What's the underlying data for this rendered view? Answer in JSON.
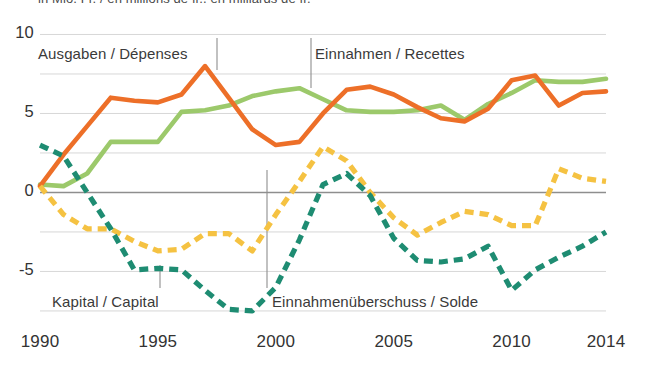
{
  "top_cut_title": "in Mio. Fr. / en millions de fr., en milliards de fr.",
  "axes": {
    "y_ticks": [
      "10",
      "5",
      "0",
      "-5"
    ],
    "y_tick_values": [
      10,
      5,
      0,
      -5
    ],
    "x_ticks": [
      "1990",
      "1995",
      "2000",
      "2005",
      "2010",
      "2014"
    ],
    "x_tick_values": [
      1990,
      1995,
      2000,
      2005,
      2010,
      2014
    ]
  },
  "annotations": [
    {
      "name": "ausgaben",
      "label": "Ausgaben / Dépenses",
      "x": 38,
      "y": 45
    },
    {
      "name": "einnahmen",
      "label": "Einnahmen / Recettes",
      "x": 315,
      "y": 45
    },
    {
      "name": "kapital",
      "label": "Kapital / Capital",
      "x": 52,
      "y": 293
    },
    {
      "name": "solde",
      "label": "Einnahmenüberschuss / Solde",
      "x": 272,
      "y": 293
    }
  ],
  "colors": {
    "ausgaben": "#ED6F28",
    "einnahmen": "#9CC96B",
    "kapital": "#F5C242",
    "solde": "#1E8C72",
    "grid": "#d7d7d7",
    "zero_line": "#8e8e8e",
    "text": "#3a3a3a",
    "background": "#ffffff"
  },
  "chart_data": {
    "type": "line",
    "title": "",
    "xlabel": "",
    "ylabel": "",
    "xlim": [
      1990,
      2014
    ],
    "ylim": [
      -8.2,
      10.6
    ],
    "grid": true,
    "grid_step": 2.5,
    "legend_position": "inline-annotations",
    "x": [
      1990,
      1991,
      1992,
      1993,
      1994,
      1995,
      1996,
      1997,
      1998,
      1999,
      2000,
      2001,
      2002,
      2003,
      2004,
      2005,
      2006,
      2007,
      2008,
      2009,
      2010,
      2011,
      2012,
      2013,
      2014
    ],
    "series": [
      {
        "name": "Ausgaben / Dépenses",
        "label": "Ausgaben / Dépenses",
        "color": "#ED6F28",
        "style": "solid",
        "values": [
          0.4,
          2.4,
          4.2,
          6.0,
          5.8,
          5.7,
          6.2,
          8.0,
          6.0,
          4.0,
          3.0,
          3.2,
          5.0,
          6.5,
          6.7,
          6.2,
          5.4,
          4.7,
          4.5,
          5.3,
          7.1,
          7.4,
          5.5,
          6.3,
          6.4
        ]
      },
      {
        "name": "Einnahmen / Recettes",
        "label": "Einnahmen / Recettes",
        "color": "#9CC96B",
        "style": "solid",
        "values": [
          0.5,
          0.4,
          1.2,
          3.2,
          3.2,
          3.2,
          5.1,
          5.2,
          5.5,
          6.1,
          6.4,
          6.6,
          5.9,
          5.2,
          5.1,
          5.1,
          5.2,
          5.5,
          4.6,
          5.6,
          6.3,
          7.1,
          7.0,
          7.0,
          7.2
        ]
      },
      {
        "name": "Kapital / Capital",
        "label": "Kapital / Capital",
        "color": "#F5C242",
        "style": "dashed",
        "values": [
          0.4,
          -1.4,
          -2.3,
          -2.3,
          -3.1,
          -3.7,
          -3.6,
          -2.6,
          -2.6,
          -3.7,
          -1.4,
          0.7,
          2.9,
          2.0,
          0.0,
          -1.6,
          -2.7,
          -1.9,
          -1.2,
          -1.4,
          -2.1,
          -2.1,
          1.5,
          0.9,
          0.7
        ]
      },
      {
        "name": "Einnahmenüberschuss / Solde",
        "label": "Einnahmenüberschuss / Solde",
        "color": "#1E8C72",
        "style": "dashed",
        "values": [
          3.0,
          2.3,
          0.0,
          -2.3,
          -4.9,
          -4.8,
          -4.9,
          -6.2,
          -7.4,
          -7.5,
          -6.0,
          -3.0,
          0.5,
          1.2,
          -0.2,
          -2.9,
          -4.3,
          -4.4,
          -4.2,
          -3.4,
          -6.2,
          -4.9,
          -4.1,
          -3.4,
          -2.5
        ]
      }
    ]
  },
  "leader_lines": [
    {
      "name": "leader-ausgaben",
      "x": 217,
      "y1": 38,
      "y2": 70
    },
    {
      "name": "leader-einnahmen",
      "x": 311,
      "y1": 38,
      "y2": 88
    },
    {
      "name": "leader-kapital",
      "x": 160,
      "y1": 265,
      "y2": 288
    },
    {
      "name": "leader-solde",
      "x": 267,
      "y1": 170,
      "y2": 288
    }
  ]
}
